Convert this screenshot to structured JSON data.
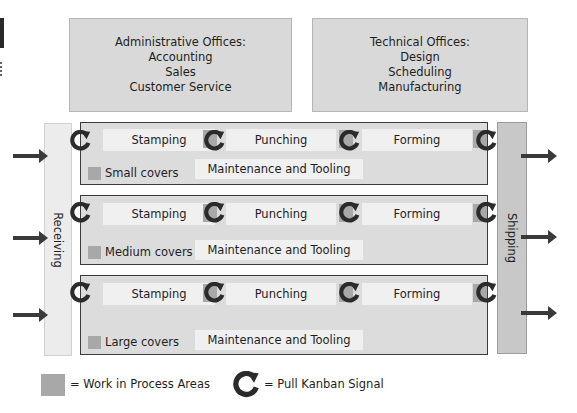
{
  "offices": {
    "administrative": {
      "title": "Administrative Offices:",
      "items": [
        "Accounting",
        "Sales",
        "Customer Service"
      ]
    },
    "technical": {
      "title": "Technical Offices:",
      "items": [
        "Design",
        "Scheduling",
        "Manufacturing"
      ]
    }
  },
  "receiving": {
    "label": "Receiving"
  },
  "shipping": {
    "label": "Shipping"
  },
  "lines": [
    {
      "name": "Small covers",
      "processes": [
        "Stamping",
        "Punching",
        "Forming"
      ],
      "maintenance": "Maintenance and Tooling"
    },
    {
      "name": "Medium covers",
      "processes": [
        "Stamping",
        "Punching",
        "Forming"
      ],
      "maintenance": "Maintenance and Tooling"
    },
    {
      "name": "Large covers",
      "processes": [
        "Stamping",
        "Punching",
        "Forming"
      ],
      "maintenance": "Maintenance and Tooling"
    }
  ],
  "legend": {
    "wip": "= Work in Process Areas",
    "kanban": "= Pull Kanban Signal"
  },
  "colors": {
    "wip": "#a8a8a8",
    "office": "#d9d9d9",
    "line_bg": "#dcdcdc",
    "arrow": "#3a3a3a"
  }
}
